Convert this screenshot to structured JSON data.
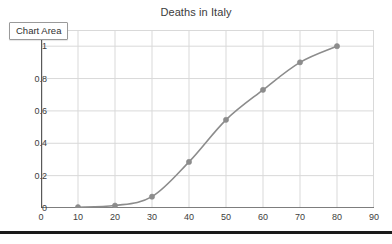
{
  "chart_data": {
    "type": "line",
    "title": "Deaths in Italy",
    "xlabel": "",
    "ylabel": "",
    "x": [
      10,
      20,
      30,
      40,
      50,
      60,
      70,
      80
    ],
    "values": [
      0.005,
      0.015,
      0.07,
      0.285,
      0.545,
      0.73,
      0.9,
      1.0
    ],
    "series": [
      {
        "name": "Deaths in Italy",
        "values": [
          0.005,
          0.015,
          0.07,
          0.285,
          0.545,
          0.73,
          0.9,
          1.0
        ]
      }
    ],
    "xlim": [
      0,
      90
    ],
    "ylim": [
      0,
      1.1
    ],
    "xticks": [
      0,
      10,
      20,
      30,
      40,
      50,
      60,
      70,
      80,
      90
    ],
    "xtick_labels": [
      "0",
      "10",
      "20",
      "30",
      "40",
      "50",
      "60",
      "70",
      "80",
      "90"
    ],
    "yticks": [
      0,
      0.2,
      0.4,
      0.6,
      0.8,
      1
    ],
    "ytick_labels": [
      "0",
      "0.2",
      "0.4",
      "0.6",
      "0.8",
      "1"
    ],
    "grid": true,
    "legend": false,
    "legend_position": "none",
    "line_color": "#8c8c8c",
    "marker_color": "#8c8c8c",
    "grid_color": "#d9d9d9",
    "axis_color": "#595959"
  },
  "overlay": {
    "chart_area_label": "Chart Area"
  }
}
